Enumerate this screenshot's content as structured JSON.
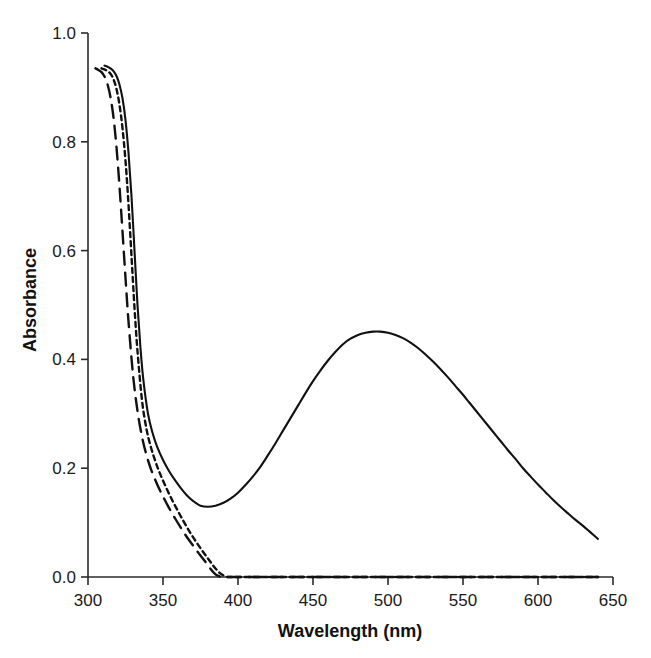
{
  "chart_data": {
    "type": "line",
    "title": "",
    "xlabel": "Wavelength (nm)",
    "ylabel": "Absorbance",
    "xlim": [
      300,
      650
    ],
    "ylim": [
      0.0,
      1.0
    ],
    "xticks": [
      300,
      350,
      400,
      450,
      500,
      550,
      600,
      650
    ],
    "xtick_labels": [
      "300",
      "350",
      "400",
      "450",
      "500",
      "550",
      "600",
      "650"
    ],
    "yticks": [
      0.0,
      0.2,
      0.4,
      0.6,
      0.8,
      1.0
    ],
    "ytick_labels": [
      "0.0",
      "0.2",
      "0.4",
      "0.6",
      "0.8",
      "1.0"
    ],
    "grid": false,
    "legend": "none",
    "line_color": "#111111",
    "series": [
      {
        "name": "solid-curve",
        "style": "solid",
        "dash": "none",
        "x": [
          311,
          313,
          315,
          317,
          319,
          321,
          323,
          325,
          327,
          329,
          331,
          333,
          335,
          337,
          340,
          343,
          346,
          350,
          354,
          358,
          362,
          366,
          370,
          375,
          380,
          385,
          390,
          395,
          400,
          405,
          410,
          415,
          420,
          425,
          430,
          435,
          440,
          445,
          450,
          455,
          460,
          465,
          470,
          475,
          480,
          485,
          490,
          495,
          500,
          505,
          510,
          515,
          520,
          525,
          530,
          535,
          540,
          545,
          550,
          555,
          560,
          565,
          570,
          575,
          580,
          585,
          590,
          595,
          600,
          605,
          610,
          615,
          620,
          625,
          630,
          635,
          640
        ],
        "y": [
          0.94,
          0.938,
          0.935,
          0.93,
          0.921,
          0.905,
          0.88,
          0.84,
          0.78,
          0.7,
          0.6,
          0.5,
          0.42,
          0.36,
          0.3,
          0.265,
          0.24,
          0.215,
          0.195,
          0.178,
          0.163,
          0.15,
          0.14,
          0.131,
          0.129,
          0.131,
          0.136,
          0.144,
          0.155,
          0.169,
          0.185,
          0.203,
          0.224,
          0.246,
          0.269,
          0.292,
          0.315,
          0.338,
          0.36,
          0.38,
          0.398,
          0.414,
          0.428,
          0.438,
          0.445,
          0.449,
          0.451,
          0.451,
          0.449,
          0.445,
          0.439,
          0.431,
          0.421,
          0.409,
          0.396,
          0.382,
          0.367,
          0.351,
          0.335,
          0.318,
          0.301,
          0.284,
          0.267,
          0.25,
          0.233,
          0.217,
          0.2,
          0.185,
          0.17,
          0.156,
          0.142,
          0.129,
          0.117,
          0.105,
          0.094,
          0.082,
          0.07
        ]
      },
      {
        "name": "short-dash-curve",
        "style": "short-dash",
        "dash": "5,4",
        "x": [
          309,
          311,
          313,
          315,
          317,
          319,
          321,
          323,
          325,
          327,
          329,
          331,
          333,
          336,
          339,
          342,
          345,
          348,
          352,
          356,
          360,
          364,
          368,
          372,
          376,
          380,
          384,
          388,
          391,
          393,
          395,
          400,
          420,
          450,
          500,
          550,
          600,
          640
        ],
        "y": [
          0.935,
          0.933,
          0.93,
          0.925,
          0.915,
          0.897,
          0.868,
          0.825,
          0.765,
          0.685,
          0.59,
          0.495,
          0.415,
          0.325,
          0.272,
          0.238,
          0.212,
          0.19,
          0.165,
          0.142,
          0.121,
          0.101,
          0.082,
          0.065,
          0.049,
          0.034,
          0.019,
          0.007,
          0.002,
          0.0,
          0.0,
          0.0,
          0.0,
          0.0,
          0.0,
          0.0,
          0.0,
          0.0
        ]
      },
      {
        "name": "long-dash-curve",
        "style": "long-dash",
        "dash": "13,8",
        "x": [
          305,
          307,
          309,
          311,
          313,
          315,
          317,
          319,
          321,
          323,
          325,
          327,
          330,
          333,
          336,
          339,
          342,
          346,
          350,
          354,
          358,
          362,
          366,
          370,
          374,
          378,
          382,
          385,
          387,
          389,
          392,
          400,
          420,
          450,
          500,
          550,
          600,
          640
        ],
        "y": [
          0.935,
          0.932,
          0.928,
          0.92,
          0.906,
          0.882,
          0.845,
          0.79,
          0.718,
          0.635,
          0.55,
          0.47,
          0.372,
          0.305,
          0.258,
          0.224,
          0.198,
          0.171,
          0.148,
          0.127,
          0.108,
          0.09,
          0.073,
          0.058,
          0.043,
          0.029,
          0.014,
          0.005,
          0.002,
          0.0,
          0.0,
          0.0,
          0.0,
          0.0,
          0.0,
          0.0,
          0.0,
          0.0
        ]
      }
    ],
    "annotations": {
      "peak_wavelength_nm": 495,
      "peak_absorbance": 0.45,
      "valley_wavelength_nm": 378,
      "valley_absorbance": 0.13
    }
  }
}
